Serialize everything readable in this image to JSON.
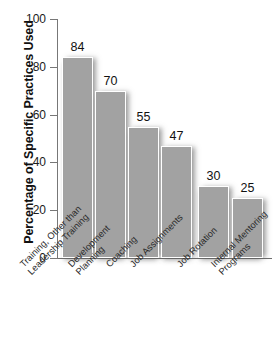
{
  "chart_data": {
    "type": "bar",
    "title": "",
    "xlabel": "",
    "ylabel": "Percentage of Specific Practices Used",
    "ylim": [
      0,
      100
    ],
    "yticks": [
      0,
      20,
      40,
      60,
      80,
      100
    ],
    "grid": false,
    "legend": "none",
    "categories": [
      "Training, Other than\nLeadership Training",
      "Development\nPlanning",
      "Coaching",
      "Job Assignments",
      "Job Rotation",
      "Internal Mentoring\nPrograms"
    ],
    "values": [
      84,
      70,
      55,
      47,
      30,
      25
    ],
    "value_labels": [
      "84",
      "70",
      "55",
      "47",
      "30",
      "25"
    ],
    "bar_color": "#a2a2a2"
  }
}
